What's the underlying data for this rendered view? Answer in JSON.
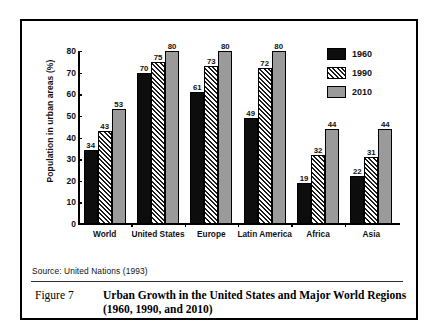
{
  "figure": {
    "number_label": "Figure 7",
    "caption": "Urban Growth in the United States and Major World Regions (1960, 1990, and 2010)",
    "source": "Source:  United Nations (1993)"
  },
  "legend": {
    "position": "top-right",
    "entries": [
      {
        "label": "1960",
        "swatch": "solid-black",
        "color": "#0d0d0d"
      },
      {
        "label": "1990",
        "swatch": "diagonal-hatch",
        "color": "#1a1a1a"
      },
      {
        "label": "2010",
        "swatch": "solid-gray",
        "color": "#9a9a9a"
      }
    ]
  },
  "chart_data": {
    "type": "bar",
    "title": "Urban Growth in the United States and Major World Regions (1960, 1990, and 2010)",
    "xlabel": "",
    "ylabel": "Population in urban areas (%)",
    "ylim": [
      0,
      80
    ],
    "yticks": [
      0,
      10,
      20,
      30,
      40,
      50,
      60,
      70,
      80
    ],
    "ytick_labels": [
      "0",
      "10",
      "20",
      "30",
      "40",
      "50",
      "60",
      "70",
      "80"
    ],
    "grid": false,
    "legend_position": "top-right",
    "categories": [
      "World",
      "United States",
      "Europe",
      "Latin America",
      "Africa",
      "Asia"
    ],
    "series": [
      {
        "name": "1960",
        "values": [
          34,
          70,
          61,
          49,
          19,
          22
        ]
      },
      {
        "name": "1990",
        "values": [
          43,
          75,
          73,
          72,
          32,
          31
        ]
      },
      {
        "name": "2010",
        "values": [
          53,
          80,
          80,
          80,
          44,
          44
        ]
      }
    ],
    "data_labels": [
      [
        "34",
        "43",
        "53"
      ],
      [
        "70",
        "75",
        "80"
      ],
      [
        "61",
        "73",
        "80"
      ],
      [
        "49",
        "72",
        "80"
      ],
      [
        "19",
        "32",
        "44"
      ],
      [
        "22",
        "31",
        "44"
      ]
    ]
  }
}
